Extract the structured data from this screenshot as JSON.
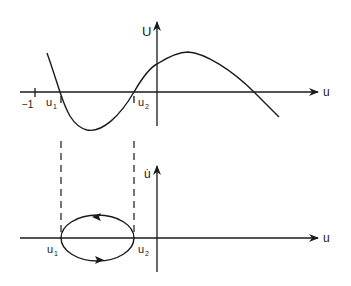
{
  "top_plot": {
    "y_axis_label": "U",
    "x_axis_label": "u",
    "tick_label_minus_one": "−1",
    "root_labels": {
      "u1": "u",
      "u1_sub": "1",
      "u2": "u",
      "u2_sub": "2"
    },
    "description": "Potential energy U(u) with local minimum between roots u1 and u2"
  },
  "bottom_plot": {
    "y_axis_label": "u̇",
    "x_axis_label": "u",
    "root_labels": {
      "u1": "u",
      "u1_sub": "1",
      "u2": "u",
      "u2_sub": "2"
    },
    "description": "Phase portrait: closed orbit between u1 and u2, clockwise direction"
  },
  "colors": {
    "ink": "#1a1a1a",
    "background": "#ffffff"
  }
}
